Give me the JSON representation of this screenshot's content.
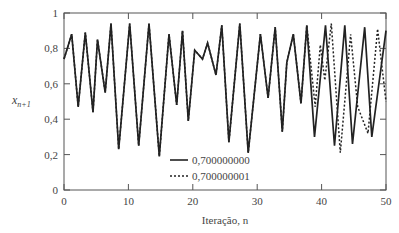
{
  "chart_data": {
    "type": "line",
    "title": "",
    "xlabel": "Iteração, n",
    "ylabel": "x_{n+1}",
    "xlim": [
      0,
      50
    ],
    "ylim": [
      0,
      1
    ],
    "x_ticks": [
      0,
      10,
      20,
      30,
      40,
      50
    ],
    "x_tick_labels": [
      "0",
      "10",
      "20",
      "30",
      "40",
      "50"
    ],
    "y_ticks": [
      0,
      0.2,
      0.4,
      0.6,
      0.8,
      1
    ],
    "y_tick_labels": [
      "0",
      "0,2",
      "0,4",
      "0,6",
      "0,8",
      "1"
    ],
    "grid": false,
    "legend_position": "lower center (inside plot)",
    "series": [
      {
        "name": "0,700000000",
        "style": "solid",
        "x": [
          0,
          1.2,
          2.2,
          3.3,
          4.5,
          5.2,
          6.4,
          7.3,
          8.5,
          10.2,
          11.6,
          13.2,
          14.8,
          16.3,
          17.5,
          18.4,
          19.3,
          20.3,
          21.5,
          22.3,
          23.6,
          24.5,
          25.6,
          27.3,
          28.6,
          30.5,
          31.7,
          32.8,
          33.9,
          34.6,
          35.6,
          36.8,
          37.7,
          38.9,
          40.6,
          42.0,
          43.6,
          44.8,
          46.7,
          47.8,
          50
        ],
        "y": [
          0.74,
          0.88,
          0.47,
          0.89,
          0.44,
          0.85,
          0.55,
          0.94,
          0.23,
          0.94,
          0.25,
          0.94,
          0.19,
          0.88,
          0.48,
          0.9,
          0.39,
          0.79,
          0.74,
          0.83,
          0.65,
          0.93,
          0.27,
          0.94,
          0.21,
          0.88,
          0.52,
          0.92,
          0.33,
          0.72,
          0.88,
          0.49,
          0.93,
          0.3,
          0.93,
          0.25,
          0.93,
          0.26,
          0.92,
          0.3,
          0.9
        ]
      },
      {
        "name": "0,700000001",
        "style": "dotted",
        "x": [
          0,
          1.2,
          2.2,
          3.3,
          4.5,
          5.2,
          6.4,
          7.3,
          8.5,
          10.2,
          11.6,
          13.2,
          14.8,
          16.3,
          17.5,
          18.4,
          19.3,
          20.3,
          21.5,
          22.3,
          23.6,
          24.5,
          25.6,
          27.3,
          28.6,
          30.5,
          31.7,
          32.8,
          33.9,
          34.6,
          35.6,
          36.8,
          37.7,
          39.0,
          39.8,
          40.5,
          41.5,
          42.9,
          44.5,
          45.6,
          47.2,
          48.7,
          50
        ],
        "y": [
          0.74,
          0.88,
          0.47,
          0.89,
          0.44,
          0.85,
          0.55,
          0.94,
          0.23,
          0.94,
          0.25,
          0.94,
          0.19,
          0.88,
          0.48,
          0.9,
          0.39,
          0.79,
          0.74,
          0.83,
          0.65,
          0.93,
          0.27,
          0.94,
          0.21,
          0.88,
          0.52,
          0.92,
          0.33,
          0.72,
          0.88,
          0.49,
          0.93,
          0.47,
          0.82,
          0.62,
          0.94,
          0.21,
          0.88,
          0.47,
          0.32,
          0.91,
          0.5
        ]
      }
    ]
  },
  "legend": {
    "items": [
      {
        "label": "0,700000000",
        "style": "solid"
      },
      {
        "label": "0,700000001",
        "style": "dotted"
      }
    ]
  },
  "colors": {
    "line": "#222222",
    "axis": "#555555",
    "text": "#444444"
  }
}
